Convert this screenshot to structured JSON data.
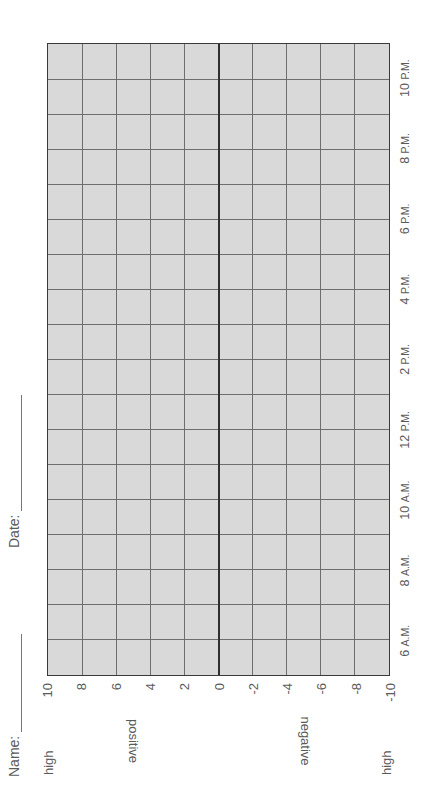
{
  "header": {
    "name_label": "Name:",
    "date_label": "Date:"
  },
  "axes": {
    "high_top": "high",
    "high_bottom": "high",
    "positive_label": "positive",
    "negative_label": "negative",
    "value_ticks": [
      "10",
      "8",
      "6",
      "4",
      "2",
      "0",
      "-2",
      "-4",
      "-6",
      "-8",
      "-10"
    ],
    "time_ticks": [
      {
        "num": "6",
        "suffix": "A.M."
      },
      {
        "num": "8",
        "suffix": "A.M."
      },
      {
        "num": "10",
        "suffix": "A.M."
      },
      {
        "num": "12",
        "suffix": "P.M."
      },
      {
        "num": "2",
        "suffix": "P.M."
      },
      {
        "num": "4",
        "suffix": "P.M."
      },
      {
        "num": "6",
        "suffix": "P.M."
      },
      {
        "num": "8",
        "suffix": "P.M."
      },
      {
        "num": "10",
        "suffix": "P.M."
      }
    ]
  },
  "grid": {
    "columns": 18,
    "rows": 10,
    "background": "#d9d9d9",
    "line_color": "#6e6e6e",
    "zero_line_color": "#2e2e2e"
  }
}
